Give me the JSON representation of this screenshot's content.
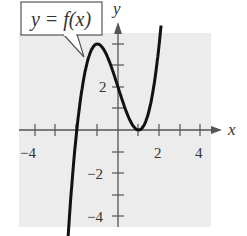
{
  "chart_data": {
    "type": "line",
    "title": "",
    "function_label": "y = f(x)",
    "xlabel": "x",
    "ylabel": "y",
    "xlim": [
      -4.5,
      4.5
    ],
    "ylim": [
      -4.5,
      4.5
    ],
    "x_ticks": [
      -4,
      -3,
      -2,
      -1,
      0,
      1,
      2,
      3,
      4
    ],
    "x_tick_labels": [
      "-4",
      "2",
      "4"
    ],
    "x_tick_label_values": [
      -4,
      2,
      4
    ],
    "y_ticks": [
      -4,
      -3,
      -2,
      -1,
      1,
      2,
      3,
      4
    ],
    "y_tick_labels": [
      "2",
      "-2",
      "-4"
    ],
    "y_tick_label_values": [
      2,
      -2,
      -4
    ],
    "grid": false,
    "background": "#ececec",
    "series": [
      {
        "name": "f(x)",
        "expression": "x^3 - 3x + 2",
        "x": [
          -2.4,
          -2.0,
          -1.5,
          -1.0,
          -0.5,
          0.0,
          0.5,
          1.0,
          1.5,
          2.0,
          2.1
        ],
        "y": [
          -4.62,
          0.0,
          3.13,
          4.0,
          3.38,
          2.0,
          0.63,
          0.0,
          0.88,
          4.0,
          4.96
        ]
      }
    ],
    "key_points": {
      "local_max": [
        -1,
        4
      ],
      "local_min": [
        1,
        0
      ],
      "y_intercept": [
        0,
        2
      ],
      "x_intercepts": [
        -2,
        1
      ]
    }
  },
  "labels": {
    "function": "y = f(x)",
    "x_axis": "x",
    "y_axis": "y",
    "x_neg4": "−4",
    "x_2": "2",
    "x_4": "4",
    "y_2": "2",
    "y_neg2": "−2",
    "y_neg4": "−4"
  }
}
